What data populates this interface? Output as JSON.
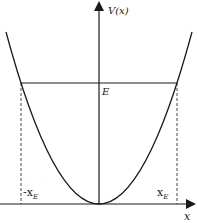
{
  "diagram": {
    "type": "potential-energy-well",
    "labels": {
      "y_axis": "V(x)",
      "x_axis": "x",
      "energy_level": "E",
      "left_turning_point": "-x",
      "right_turning_point": "x",
      "turning_point_subscript": "E"
    },
    "elements": {
      "curve": "parabola V(x) ∝ x², vertex at origin",
      "energy_line": "horizontal line at V = E",
      "turning_points": "dashed vertical lines at x = ±x_E"
    },
    "colors": {
      "stroke": "#1a1a1a",
      "background": "#ffffff"
    }
  }
}
